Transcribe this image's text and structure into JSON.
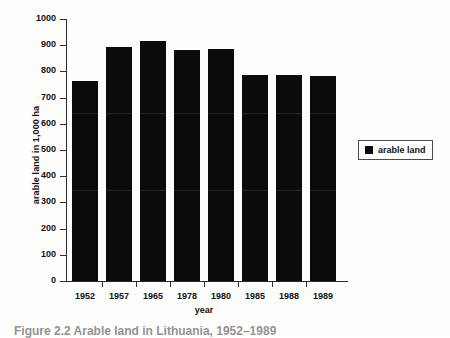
{
  "chart_data": {
    "type": "bar",
    "title": "",
    "categories": [
      "1952",
      "1957",
      "1965",
      "1978",
      "1980",
      "1985",
      "1988",
      "1989"
    ],
    "values": [
      763,
      893,
      916,
      883,
      887,
      785,
      785,
      781
    ],
    "series": [
      {
        "name": "arable land",
        "values": [
          763,
          893,
          916,
          883,
          887,
          785,
          785,
          781
        ],
        "color": "#0b0b0b"
      }
    ],
    "xlabel": "year",
    "ylabel": "arable land in 1,000 ha",
    "ylim": [
      0,
      1000
    ],
    "ytick_labels": [
      "1000",
      "900",
      "800",
      "700",
      "600",
      "500",
      "400",
      "300",
      "200",
      "100",
      "0"
    ],
    "ytick_values": [
      1000,
      900,
      800,
      700,
      600,
      500,
      400,
      300,
      200,
      100,
      0
    ],
    "grid": false,
    "legend": {
      "position": "right",
      "entries": [
        {
          "label": "arable land",
          "color": "#0b0b0b",
          "marker": "square"
        }
      ]
    }
  },
  "figure": {
    "caption": "Figure 2.2  Arable land in Lithuania, 1952–1989",
    "background_color": "#fdfdfc",
    "axis_color": "#2a2a2a",
    "bar_color": "#0b0b0b"
  }
}
